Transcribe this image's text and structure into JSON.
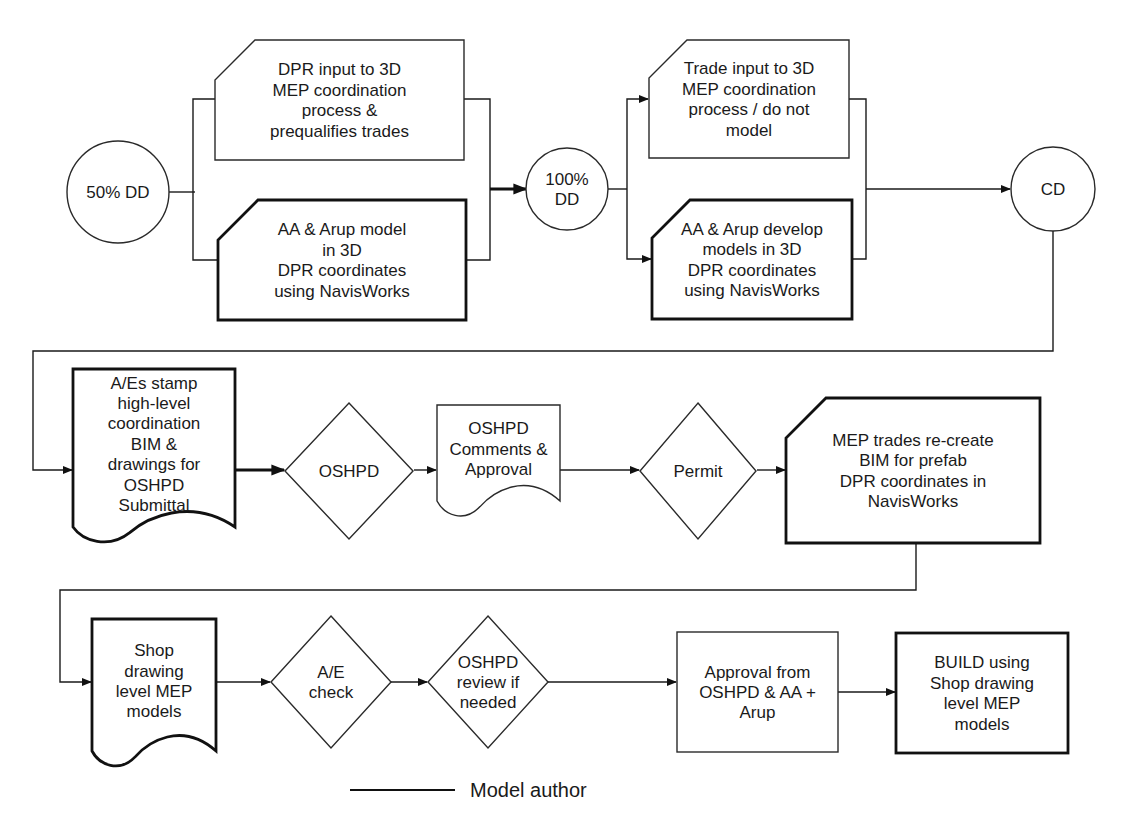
{
  "diagram": {
    "colors": {
      "background": "#ffffff",
      "stroke": "#1a1a1a",
      "text": "#1a1a1a"
    },
    "font_size": 17,
    "nodes": [
      {
        "id": "dd50",
        "shape": "circle",
        "cx": 118,
        "cy": 192,
        "r": 51,
        "weight": "thin",
        "lines": [
          "50% DD"
        ]
      },
      {
        "id": "dpr_input",
        "shape": "card",
        "x": 215,
        "y": 40,
        "w": 249,
        "h": 120,
        "cut": 40,
        "weight": "thin",
        "lines": [
          "DPR input to 3D",
          "MEP coordination",
          "process &",
          "prequalifies trades"
        ]
      },
      {
        "id": "aa_arup_model",
        "shape": "card",
        "x": 218,
        "y": 200,
        "w": 248,
        "h": 120,
        "cut": 40,
        "weight": "thick",
        "lines": [
          "AA & Arup model",
          "in 3D",
          "DPR coordinates",
          "using NavisWorks"
        ]
      },
      {
        "id": "dd100",
        "shape": "circle",
        "cx": 567,
        "cy": 189,
        "r": 41,
        "weight": "thin",
        "lines": [
          "100%",
          "DD"
        ]
      },
      {
        "id": "trade_input",
        "shape": "card",
        "x": 649,
        "y": 40,
        "w": 200,
        "h": 118,
        "cut": 38,
        "weight": "thin",
        "lines": [
          "Trade input to 3D",
          "MEP coordination",
          "process / do not",
          "model"
        ]
      },
      {
        "id": "aa_arup_develop",
        "shape": "card",
        "x": 652,
        "y": 200,
        "w": 200,
        "h": 119,
        "cut": 38,
        "weight": "thick",
        "lines": [
          "AA & Arup develop",
          "models in 3D",
          "DPR coordinates",
          "using NavisWorks"
        ]
      },
      {
        "id": "cd",
        "shape": "circle",
        "cx": 1053,
        "cy": 189,
        "r": 42,
        "weight": "thin",
        "lines": [
          "CD"
        ]
      },
      {
        "id": "aes_stamp",
        "shape": "document",
        "x": 73,
        "y": 369,
        "w": 162,
        "h": 172,
        "weight": "thick",
        "lines": [
          "A/Es stamp",
          "high-level",
          "coordination",
          "BIM &",
          "drawings  for",
          "OSHPD",
          "Submittal"
        ]
      },
      {
        "id": "oshpd_decision",
        "shape": "diamond",
        "cx": 349,
        "cy": 471,
        "rx": 64,
        "ry": 68,
        "weight": "thin",
        "lines": [
          "OSHPD"
        ]
      },
      {
        "id": "oshpd_comments",
        "shape": "document",
        "x": 437,
        "y": 405,
        "w": 123,
        "h": 110,
        "weight": "thin",
        "lines": [
          "OSHPD",
          "Comments &",
          "Approval"
        ]
      },
      {
        "id": "permit",
        "shape": "diamond",
        "cx": 698,
        "cy": 471,
        "rx": 58,
        "ry": 68,
        "weight": "thin",
        "lines": [
          "Permit"
        ]
      },
      {
        "id": "mep_recreate",
        "shape": "card",
        "x": 786,
        "y": 398,
        "w": 254,
        "h": 145,
        "cut": 40,
        "weight": "thick",
        "lines": [
          "MEP trades re-create",
          "BIM for prefab",
          "DPR coordinates  in",
          "NavisWorks"
        ]
      },
      {
        "id": "shop_drawing",
        "shape": "document",
        "x": 92,
        "y": 619,
        "w": 124,
        "h": 146,
        "weight": "thick",
        "lines": [
          "Shop",
          "drawing",
          "level MEP",
          "models"
        ]
      },
      {
        "id": "ae_check",
        "shape": "diamond",
        "cx": 331,
        "cy": 682,
        "rx": 60,
        "ry": 66,
        "weight": "thin",
        "lines": [
          "A/E",
          "check"
        ]
      },
      {
        "id": "oshpd_review",
        "shape": "diamond",
        "cx": 488,
        "cy": 682,
        "rx": 60,
        "ry": 66,
        "weight": "thin",
        "lines": [
          "OSHPD",
          "review if",
          "needed"
        ]
      },
      {
        "id": "approval",
        "shape": "rect",
        "x": 677,
        "y": 632,
        "w": 161,
        "h": 120,
        "weight": "thin",
        "lines": [
          "Approval from",
          "OSHPD & AA +",
          "Arup"
        ]
      },
      {
        "id": "build",
        "shape": "rect",
        "x": 896,
        "y": 633,
        "w": 172,
        "h": 120,
        "weight": "thick",
        "lines": [
          "BUILD using",
          "Shop drawing",
          "level MEP",
          "models"
        ]
      }
    ],
    "connectors": [
      {
        "id": "dd50-split",
        "weight": "thin",
        "arrow": false,
        "points": [
          [
            169,
            192
          ],
          [
            195,
            192
          ]
        ]
      },
      {
        "id": "split-left-bus",
        "weight": "thin",
        "arrow": false,
        "points": [
          [
            217,
            99
          ],
          [
            193,
            99
          ],
          [
            193,
            260
          ],
          [
            218,
            260
          ]
        ]
      },
      {
        "id": "merge-right-bus",
        "weight": "thin",
        "arrow": false,
        "points": [
          [
            464,
            99
          ],
          [
            490,
            99
          ],
          [
            490,
            260
          ],
          [
            466,
            260
          ]
        ]
      },
      {
        "id": "merge-to-dd100",
        "weight": "thick",
        "arrow": true,
        "points": [
          [
            490,
            189
          ],
          [
            526,
            189
          ]
        ]
      },
      {
        "id": "dd100-split",
        "weight": "thin",
        "arrow": false,
        "points": [
          [
            608,
            189
          ],
          [
            627,
            189
          ]
        ]
      },
      {
        "id": "to-trade-input",
        "weight": "thin",
        "arrow": true,
        "points": [
          [
            627,
            189
          ],
          [
            627,
            99
          ],
          [
            648,
            99
          ]
        ]
      },
      {
        "id": "to-aa-develop",
        "weight": "thin",
        "arrow": true,
        "points": [
          [
            627,
            189
          ],
          [
            627,
            259
          ],
          [
            651,
            259
          ]
        ]
      },
      {
        "id": "merge2-bus",
        "weight": "thin",
        "arrow": false,
        "points": [
          [
            849,
            99
          ],
          [
            866,
            99
          ],
          [
            866,
            259
          ],
          [
            852,
            259
          ]
        ]
      },
      {
        "id": "merge2-to-cd",
        "weight": "thin",
        "arrow": true,
        "points": [
          [
            866,
            189
          ],
          [
            1010,
            189
          ]
        ]
      },
      {
        "id": "cd-to-aes",
        "weight": "thin",
        "arrow": true,
        "points": [
          [
            1053,
            231
          ],
          [
            1053,
            351
          ],
          [
            33,
            351
          ],
          [
            33,
            470
          ],
          [
            72,
            470
          ]
        ]
      },
      {
        "id": "aes-to-oshpd",
        "weight": "thick",
        "arrow": true,
        "points": [
          [
            235,
            470
          ],
          [
            284,
            470
          ]
        ]
      },
      {
        "id": "oshpd-to-comments",
        "weight": "thin",
        "arrow": true,
        "points": [
          [
            414,
            470
          ],
          [
            436,
            470
          ]
        ]
      },
      {
        "id": "comments-to-permit",
        "weight": "thin",
        "arrow": true,
        "points": [
          [
            560,
            470
          ],
          [
            639,
            470
          ]
        ]
      },
      {
        "id": "permit-to-mep",
        "weight": "thin",
        "arrow": true,
        "points": [
          [
            757,
            470
          ],
          [
            785,
            470
          ]
        ]
      },
      {
        "id": "mep-to-shop",
        "weight": "thin",
        "arrow": true,
        "points": [
          [
            916,
            543
          ],
          [
            916,
            590
          ],
          [
            60,
            590
          ],
          [
            60,
            682
          ],
          [
            91,
            682
          ]
        ]
      },
      {
        "id": "shop-to-aecheck",
        "weight": "thin",
        "arrow": true,
        "points": [
          [
            216,
            682
          ],
          [
            270,
            682
          ]
        ]
      },
      {
        "id": "aecheck-to-review",
        "weight": "thin",
        "arrow": true,
        "points": [
          [
            391,
            682
          ],
          [
            427,
            682
          ]
        ]
      },
      {
        "id": "review-to-approval",
        "weight": "thin",
        "arrow": true,
        "points": [
          [
            548,
            682
          ],
          [
            676,
            682
          ]
        ]
      },
      {
        "id": "approval-to-build",
        "weight": "thin",
        "arrow": true,
        "points": [
          [
            838,
            692
          ],
          [
            895,
            692
          ]
        ]
      }
    ]
  },
  "legend": {
    "label": "Model author",
    "line": {
      "x1": 350,
      "x2": 455,
      "y": 790
    },
    "text_x": 470,
    "text_y": 797
  }
}
